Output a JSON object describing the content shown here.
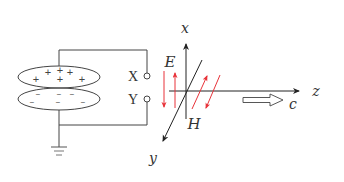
{
  "figure": {
    "title": ""
  },
  "circuit": {
    "top_plate_charges": [
      "+",
      "+",
      "+",
      "+",
      "+",
      "+"
    ],
    "bottom_plate_charges": [
      "−",
      "−",
      "−",
      "−",
      "−",
      "−"
    ],
    "terminal_top_label": "X",
    "terminal_bottom_label": "Y",
    "ground_icon": "ground-icon"
  },
  "axes": {
    "x_label": "x",
    "y_label": "y",
    "z_label": "z"
  },
  "fields": {
    "electric_label": "E",
    "magnetic_label": "H",
    "speed_label": "c",
    "field_arrow_color": "#e8333a",
    "line_color": "#333333"
  }
}
